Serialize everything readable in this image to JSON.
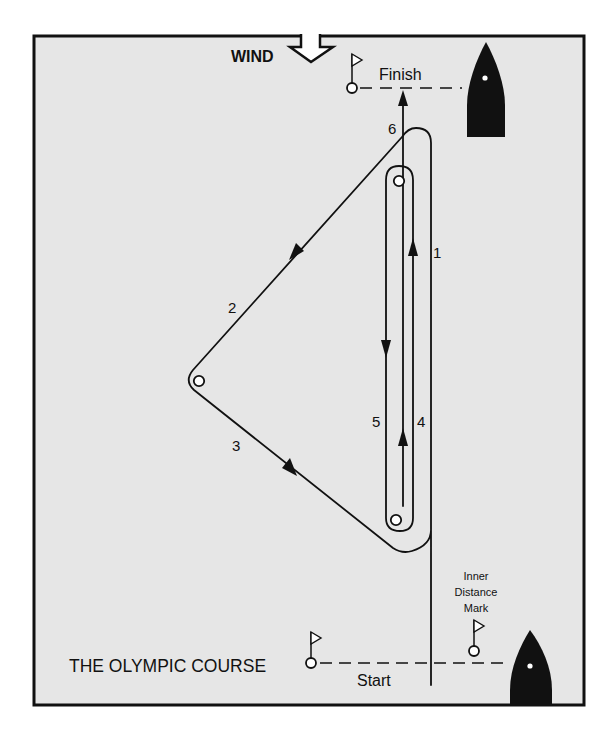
{
  "title": "THE OLYMPIC COURSE",
  "wind_label": "WIND",
  "finish_label": "Finish",
  "start_label": "Start",
  "inner_distance_mark_label": [
    "Inner",
    "Distance",
    "Mark"
  ],
  "legs": [
    {
      "number": "1",
      "direction": "upwind"
    },
    {
      "number": "2",
      "direction": "reach-down-left"
    },
    {
      "number": "3",
      "direction": "reach-down-right"
    },
    {
      "number": "4",
      "direction": "upwind"
    },
    {
      "number": "5",
      "direction": "downwind"
    },
    {
      "number": "6",
      "direction": "upwind-to-finish"
    }
  ],
  "icons": {
    "wind": "wind-direction-arrow-icon",
    "mark": "buoy-mark-icon",
    "flag": "flag-icon",
    "committee_boat": "committee-boat-icon"
  },
  "colors": {
    "background": "#e6e6e6",
    "ink": "#111111",
    "page": "#ffffff"
  }
}
